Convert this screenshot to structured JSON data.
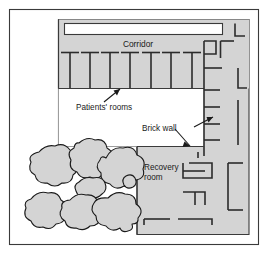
{
  "figure": {
    "type": "floor-plan-diagram",
    "border_color": "#3a3a3a",
    "fill_color": "#d4d4d4",
    "wall_color": "#333333",
    "background_color": "#ffffff",
    "courtyard_color": "#ffffff"
  },
  "labels": {
    "corridor": "Corridor",
    "patients_rooms": "Patients' rooms",
    "brick_wall": "Brick wall",
    "recovery_line1": "Recovery",
    "recovery_line2": "room"
  },
  "counts": {
    "patient_room_partitions": 7,
    "tree_canopies": 8
  }
}
